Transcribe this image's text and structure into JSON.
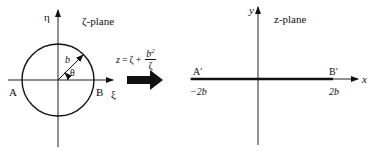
{
  "figure": {
    "zeta_plane": {
      "title": "ζ-plane",
      "vertical_axis_label": "η",
      "horizontal_axis_label": "ξ",
      "point_left": "A",
      "point_right": "B",
      "radius_label": "b",
      "angle_label": "θ",
      "shape": "circle of radius b centered at origin"
    },
    "mapping": {
      "lhs": "z",
      "equals": "=",
      "term1": "ζ",
      "plus": "+",
      "numerator": "b",
      "numerator_power": "2",
      "denominator": "ζ",
      "arrow": "right-arrow"
    },
    "z_plane": {
      "title": "z-plane",
      "vertical_axis_label": "y",
      "horizontal_axis_label": "x",
      "point_left": "A′",
      "point_right": "B′",
      "left_tick": "−2b",
      "right_tick": "2b",
      "shape": "flat plate (slit) from −2b to 2b"
    }
  },
  "colors": {
    "ink": "#111111",
    "background": "#ffffff"
  }
}
